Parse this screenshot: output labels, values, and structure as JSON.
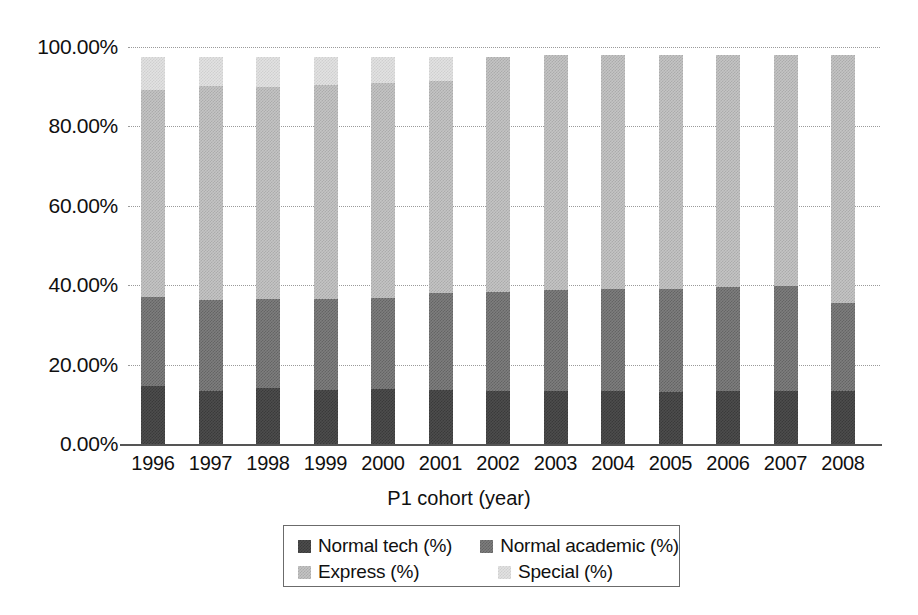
{
  "chart_data": {
    "type": "bar",
    "stacked": true,
    "title": "",
    "xlabel": "P1 cohort (year)",
    "ylabel": "",
    "ylim": [
      0,
      100
    ],
    "ytick_labels": [
      "100.00%",
      "80.00%",
      "60.00%",
      "40.00%",
      "20.00%",
      "0.00%"
    ],
    "ytick_values": [
      100,
      80,
      60,
      40,
      20,
      0
    ],
    "grid": true,
    "legend_position": "bottom",
    "categories": [
      "1996",
      "1997",
      "1998",
      "1999",
      "2000",
      "2001",
      "2002",
      "2003",
      "2004",
      "2005",
      "2006",
      "2007",
      "2008"
    ],
    "series": [
      {
        "name": "Normal tech (%)",
        "color": "#4d4d4d",
        "values": [
          14.6,
          13.3,
          14.2,
          13.6,
          13.9,
          13.6,
          13.4,
          13.4,
          13.4,
          13.2,
          13.4,
          13.4,
          13.4
        ]
      },
      {
        "name": "Normal academic (%)",
        "color": "#7e7e7e",
        "values": [
          22.4,
          23.0,
          22.4,
          23.0,
          23.0,
          24.4,
          24.9,
          25.5,
          25.7,
          25.9,
          26.1,
          26.3,
          22.2
        ]
      },
      {
        "name": "Express (%)",
        "color": "#c4c4c4",
        "values": [
          52.1,
          54.0,
          53.3,
          53.8,
          54.1,
          53.5,
          59.2,
          59.1,
          58.9,
          58.9,
          58.5,
          58.3,
          62.4
        ]
      },
      {
        "name": "Special (%)",
        "color": "#e2e2e2",
        "values": [
          8.4,
          7.2,
          7.6,
          7.1,
          6.5,
          6.0,
          0.0,
          0.0,
          0.0,
          0.0,
          0.0,
          0.0,
          0.0
        ]
      }
    ],
    "legend_entries": [
      "Normal tech (%)",
      "Normal academic (%)",
      "Express (%)",
      "Special (%)"
    ]
  }
}
